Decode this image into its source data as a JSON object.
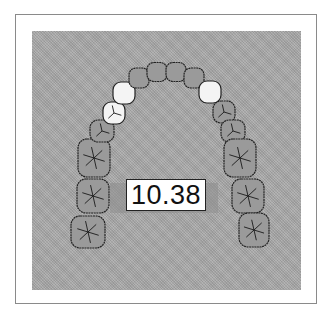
{
  "diagram": {
    "type": "dental-arch",
    "measurement_label": "10.38",
    "colors": {
      "background_panel": "#a9a9a9",
      "tooth_fill": "#9a9a9a",
      "highlighted_tooth_fill": "#f4f4f4",
      "outline": "#222222",
      "frame": "#8a8a8a"
    },
    "teeth": [
      {
        "id": "R-molar-3",
        "cx": 88,
        "cy": 232,
        "w": 34,
        "h": 32,
        "highlight": false,
        "kind": "molar"
      },
      {
        "id": "R-molar-2",
        "cx": 93,
        "cy": 196,
        "w": 32,
        "h": 34,
        "highlight": false,
        "kind": "molar"
      },
      {
        "id": "R-molar-1",
        "cx": 94,
        "cy": 158,
        "w": 32,
        "h": 38,
        "highlight": false,
        "kind": "molar"
      },
      {
        "id": "R-premolar-2",
        "cx": 102,
        "cy": 131,
        "w": 24,
        "h": 22,
        "highlight": false,
        "kind": "premolar"
      },
      {
        "id": "R-premolar-1",
        "cx": 114,
        "cy": 113,
        "w": 22,
        "h": 22,
        "highlight": true,
        "kind": "premolar"
      },
      {
        "id": "R-canine",
        "cx": 124,
        "cy": 93,
        "w": 22,
        "h": 22,
        "highlight": true,
        "kind": "canine"
      },
      {
        "id": "R-lateral",
        "cx": 139,
        "cy": 78,
        "w": 20,
        "h": 20,
        "highlight": false,
        "kind": "incisor"
      },
      {
        "id": "R-central",
        "cx": 157,
        "cy": 72,
        "w": 20,
        "h": 19,
        "highlight": false,
        "kind": "incisor"
      },
      {
        "id": "L-central",
        "cx": 176,
        "cy": 72,
        "w": 20,
        "h": 19,
        "highlight": false,
        "kind": "incisor"
      },
      {
        "id": "L-lateral",
        "cx": 194,
        "cy": 78,
        "w": 20,
        "h": 20,
        "highlight": false,
        "kind": "incisor"
      },
      {
        "id": "L-canine",
        "cx": 210,
        "cy": 92,
        "w": 22,
        "h": 22,
        "highlight": true,
        "kind": "canine"
      },
      {
        "id": "L-premolar-1",
        "cx": 224,
        "cy": 112,
        "w": 22,
        "h": 22,
        "highlight": false,
        "kind": "premolar"
      },
      {
        "id": "L-premolar-2",
        "cx": 233,
        "cy": 131,
        "w": 24,
        "h": 22,
        "highlight": false,
        "kind": "premolar"
      },
      {
        "id": "L-molar-1",
        "cx": 240,
        "cy": 158,
        "w": 32,
        "h": 38,
        "highlight": false,
        "kind": "molar"
      },
      {
        "id": "L-molar-2",
        "cx": 248,
        "cy": 196,
        "w": 32,
        "h": 34,
        "highlight": false,
        "kind": "molar"
      },
      {
        "id": "L-molar-3",
        "cx": 254,
        "cy": 230,
        "w": 30,
        "h": 34,
        "highlight": false,
        "kind": "molar"
      }
    ]
  }
}
